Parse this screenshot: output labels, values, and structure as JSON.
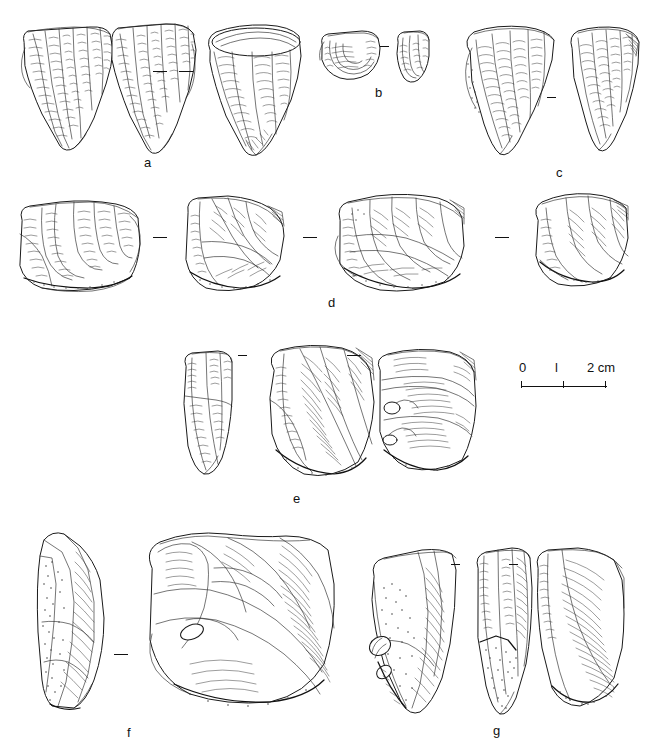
{
  "figure": {
    "type": "archaeological-lithic-plate",
    "medium": "pen-and-ink line drawing",
    "background_color": "#ffffff",
    "ink_color": "#1a1a1a",
    "width_px": 647,
    "height_px": 750
  },
  "groups": [
    {
      "id": "a",
      "label": "a",
      "label_x": 144,
      "label_y": 156,
      "views": 3,
      "artifact_type": "prismatic blade core",
      "separators": [
        {
          "x": 160,
          "y": 71,
          "size": "normal"
        },
        {
          "x": 186,
          "y": 71,
          "size": "normal"
        }
      ]
    },
    {
      "id": "b",
      "label": "b",
      "label_x": 375,
      "label_y": 86,
      "views": 2,
      "artifact_type": "small discoidal core fragment",
      "separators": [
        {
          "x": 384,
          "y": 46,
          "size": "small"
        }
      ]
    },
    {
      "id": "c",
      "label": "c",
      "label_x": 556,
      "label_y": 166,
      "views": 2,
      "artifact_type": "conical blade core",
      "separators": [
        {
          "x": 551,
          "y": 97,
          "size": "small"
        }
      ]
    },
    {
      "id": "d",
      "label": "d",
      "label_x": 328,
      "label_y": 296,
      "views": 4,
      "artifact_type": "Levallois core",
      "separators": [
        {
          "x": 160,
          "y": 237,
          "size": "normal"
        },
        {
          "x": 310,
          "y": 237,
          "size": "normal"
        },
        {
          "x": 502,
          "y": 237,
          "size": "normal"
        }
      ]
    },
    {
      "id": "e",
      "label": "e",
      "label_x": 293,
      "label_y": 492,
      "views": 3,
      "artifact_type": "discoidal Levallois core",
      "separators": [
        {
          "x": 238,
          "y": 355,
          "size": "small"
        },
        {
          "x": 347,
          "y": 355,
          "size": "normal"
        }
      ]
    },
    {
      "id": "f",
      "label": "f",
      "label_x": 127,
      "label_y": 726,
      "views": 2,
      "artifact_type": "large cortical flake / core",
      "separators": [
        {
          "x": 117,
          "y": 654,
          "size": "normal"
        }
      ]
    },
    {
      "id": "g",
      "label": "g",
      "label_x": 493,
      "label_y": 724,
      "views": 3,
      "artifact_type": "pointed flake with cortex",
      "separators": [
        {
          "x": 451,
          "y": 564,
          "size": "small"
        },
        {
          "x": 509,
          "y": 564,
          "size": "small"
        }
      ]
    }
  ],
  "scale_bar": {
    "x": 519,
    "y": 361,
    "unit": "cm",
    "labels": [
      "0",
      "l",
      "2 cm"
    ],
    "zero_label": "0",
    "one_label": "l",
    "two_label": "2 cm",
    "tick_values": [
      0,
      1,
      2
    ],
    "length_px": 86
  }
}
